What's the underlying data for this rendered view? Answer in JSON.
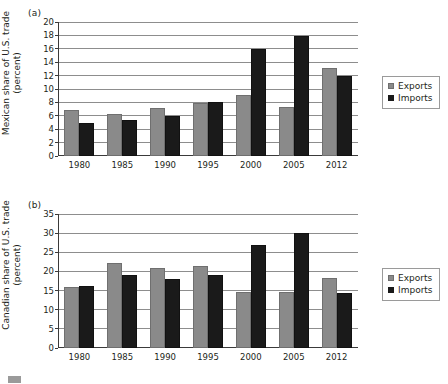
{
  "figure": {
    "panels": [
      {
        "tag": "(a)",
        "ylabel_line1": "Mexican share of U.S. trade",
        "ylabel_line2": "(percent)"
      },
      {
        "tag": "(b)",
        "ylabel_line1": "Canadian share of U.S. trade",
        "ylabel_line2": "(percent)"
      }
    ],
    "legend": {
      "exports_label": "Exports",
      "imports_label": "Imports"
    },
    "colors": {
      "exports": "#8a8a8a",
      "imports": "#1a1a1a",
      "gridline": "#8d8d8d",
      "axis": "#3a3a3a"
    }
  },
  "chart_data": [
    {
      "type": "bar",
      "title": "(a)",
      "xlabel": "",
      "ylabel": "Mexican share of U.S. trade (percent)",
      "categories": [
        "1980",
        "1985",
        "1990",
        "1995",
        "2000",
        "2005",
        "2012"
      ],
      "series": [
        {
          "name": "Exports",
          "values": [
            6.9,
            6.3,
            7.1,
            7.9,
            9.1,
            7.3,
            13.2
          ]
        },
        {
          "name": "Imports",
          "values": [
            5.0,
            5.4,
            5.9,
            8.1,
            15.9,
            17.9,
            11.9
          ]
        }
      ],
      "ylim": [
        0,
        20
      ],
      "yticks": [
        0,
        2,
        4,
        6,
        8,
        10,
        12,
        14,
        16,
        18,
        20
      ],
      "grid": true,
      "legend_position": "right"
    },
    {
      "type": "bar",
      "title": "(b)",
      "xlabel": "",
      "ylabel": "Canadian share of U.S. trade (percent)",
      "categories": [
        "1980",
        "1985",
        "1990",
        "1995",
        "2000",
        "2005",
        "2012"
      ],
      "series": [
        {
          "name": "Exports",
          "values": [
            15.9,
            22.2,
            21.0,
            21.5,
            14.7,
            14.6,
            18.4
          ]
        },
        {
          "name": "Imports",
          "values": [
            16.3,
            19.2,
            18.0,
            19.1,
            26.8,
            30.1,
            14.4
          ]
        }
      ],
      "ylim": [
        0,
        35
      ],
      "yticks": [
        0,
        5,
        10,
        15,
        20,
        25,
        30,
        35
      ],
      "grid": true,
      "legend_position": "right"
    }
  ]
}
